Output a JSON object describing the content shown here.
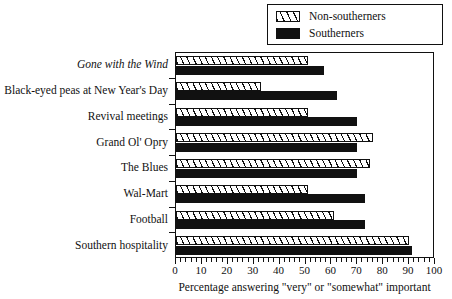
{
  "legend": {
    "entries": [
      {
        "label": "Non-southerners",
        "swatch": "hatched-swatch-icon",
        "color": "#ffffff"
      },
      {
        "label": "Southerners",
        "swatch": "solid-swatch-icon",
        "color": "#111111"
      }
    ]
  },
  "axis": {
    "x_title": "Percentage answering \"very\" or \"somewhat\" important",
    "x_ticks": [
      "0",
      "10",
      "20",
      "30",
      "40",
      "50",
      "60",
      "70",
      "80",
      "90",
      "100"
    ]
  },
  "chart_data": {
    "type": "bar",
    "orientation": "horizontal",
    "title": "",
    "xlabel": "Percentage answering \"very\" or \"somewhat\" important",
    "ylabel": "",
    "xlim": [
      0,
      100
    ],
    "xticks": [
      0,
      10,
      20,
      30,
      40,
      50,
      60,
      70,
      80,
      90,
      100
    ],
    "grid": false,
    "legend_position": "top-right",
    "categories": [
      "Gone with the Wind",
      "Black-eyed peas at New Year's Day",
      "Revival meetings",
      "Grand Ol' Opry",
      "The Blues",
      "Wal-Mart",
      "Football",
      "Southern hospitality"
    ],
    "series": [
      {
        "name": "Non-southerners",
        "values": [
          51,
          33,
          51,
          76,
          75,
          51,
          61,
          90
        ]
      },
      {
        "name": "Southerners",
        "values": [
          57,
          62,
          70,
          70,
          70,
          73,
          73,
          91
        ]
      }
    ]
  }
}
